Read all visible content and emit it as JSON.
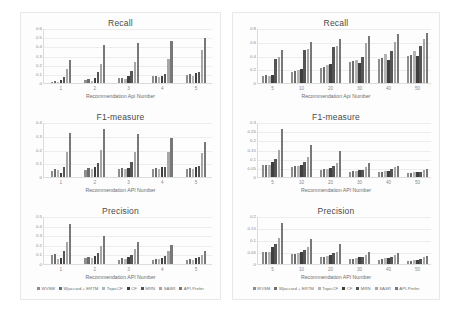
{
  "figure": {
    "background": "#ffffff",
    "panel_background": "#fdfdfd",
    "panel_border": "#e8e8e8"
  },
  "series_names": [
    "WVSM",
    "Wjaccard + ERTM",
    "TopicCF",
    "CF",
    "MRN",
    "SASR",
    "API-Prefer"
  ],
  "series_colors": [
    "#8e8e8e",
    "#6d6d6d",
    "#b4b4b4",
    "#3f3f3f",
    "#555555",
    "#a6a6a6",
    "#787878"
  ],
  "legend": {
    "items": [
      {
        "label": "WVSM",
        "color": "#8e8e8e"
      },
      {
        "label": "Wjaccard + ERTM",
        "color": "#6d6d6d"
      },
      {
        "label": "TopicCF",
        "color": "#b4b4b4"
      },
      {
        "label": "CF",
        "color": "#3f3f3f"
      },
      {
        "label": "MRN",
        "color": "#555555"
      },
      {
        "label": "SASR",
        "color": "#a6a6a6"
      },
      {
        "label": "API-Prefer",
        "color": "#787878"
      }
    ]
  },
  "chart_data": [
    {
      "id": "left-recall",
      "panel": "left",
      "type": "bar",
      "title": "Recall",
      "xlabel": "Recommendation Api Number",
      "ylabel": "",
      "categories": [
        "1",
        "2",
        "3",
        "4",
        "5"
      ],
      "yticks": [
        0,
        0.1,
        0.2,
        0.3,
        0.4,
        0.5,
        0.6
      ],
      "ylim": [
        0,
        0.6
      ],
      "grid": true,
      "legend_position": "bottom",
      "series": [
        {
          "name": "WVSM",
          "values": [
            0.012,
            0.03,
            0.055,
            0.072,
            0.082
          ]
        },
        {
          "name": "Wjaccard + ERTM",
          "values": [
            0.022,
            0.048,
            0.06,
            0.08,
            0.1
          ]
        },
        {
          "name": "TopicCF",
          "values": [
            0.012,
            0.022,
            0.048,
            0.068,
            0.078
          ]
        },
        {
          "name": "CF",
          "values": [
            0.03,
            0.06,
            0.075,
            0.078,
            0.11
          ]
        },
        {
          "name": "MRN",
          "values": [
            0.068,
            0.115,
            0.135,
            0.1,
            0.115
          ]
        },
        {
          "name": "SASR",
          "values": [
            0.15,
            0.21,
            0.23,
            0.265,
            0.365
          ]
        },
        {
          "name": "API-Prefer",
          "values": [
            0.255,
            0.41,
            0.44,
            0.455,
            0.495
          ]
        }
      ]
    },
    {
      "id": "right-recall",
      "panel": "right",
      "type": "bar",
      "title": "Recall",
      "xlabel": "Recommendation Api Number",
      "ylabel": "",
      "categories": [
        "5",
        "10",
        "20",
        "30",
        "40",
        "50"
      ],
      "yticks": [
        0,
        0.2,
        0.4,
        0.6,
        0.8
      ],
      "ylim": [
        0,
        0.8
      ],
      "grid": true,
      "legend_position": "bottom",
      "series": [
        {
          "name": "WVSM",
          "values": [
            0.105,
            0.165,
            0.215,
            0.31,
            0.355,
            0.395
          ]
        },
        {
          "name": "Wjaccard + ERTM",
          "values": [
            0.11,
            0.17,
            0.24,
            0.325,
            0.36,
            0.41
          ]
        },
        {
          "name": "TopicCF",
          "values": [
            0.105,
            0.185,
            0.255,
            0.33,
            0.42,
            0.46
          ]
        },
        {
          "name": "CF",
          "values": [
            0.115,
            0.205,
            0.275,
            0.29,
            0.34,
            0.395
          ]
        },
        {
          "name": "MRN",
          "values": [
            0.35,
            0.48,
            0.52,
            0.375,
            0.465,
            0.54
          ]
        },
        {
          "name": "SASR",
          "values": [
            0.375,
            0.5,
            0.535,
            0.58,
            0.6,
            0.64
          ]
        },
        {
          "name": "API-Prefer",
          "values": [
            0.48,
            0.59,
            0.645,
            0.68,
            0.715,
            0.73
          ]
        }
      ]
    },
    {
      "id": "left-f1",
      "panel": "left",
      "type": "bar",
      "title": "F1-measure",
      "xlabel": "Recommendation API Number",
      "ylabel": "",
      "categories": [
        "1",
        "2",
        "3",
        "4",
        "5"
      ],
      "yticks": [
        0,
        0.1,
        0.2,
        0.3,
        0.4
      ],
      "ylim": [
        0,
        0.4
      ],
      "grid": true,
      "legend_position": "bottom",
      "series": [
        {
          "name": "WVSM",
          "values": [
            0.045,
            0.05,
            0.06,
            0.06,
            0.058
          ]
        },
        {
          "name": "Wjaccard + ERTM",
          "values": [
            0.055,
            0.068,
            0.062,
            0.068,
            0.062
          ]
        },
        {
          "name": "TopicCF",
          "values": [
            0.048,
            0.06,
            0.055,
            0.06,
            0.06
          ]
        },
        {
          "name": "CF",
          "values": [
            0.028,
            0.07,
            0.065,
            0.07,
            0.075
          ]
        },
        {
          "name": "MRN",
          "values": [
            0.07,
            0.105,
            0.11,
            0.07,
            0.08
          ]
        },
        {
          "name": "SASR",
          "values": [
            0.18,
            0.195,
            0.185,
            0.18,
            0.175
          ]
        },
        {
          "name": "API-Prefer",
          "values": [
            0.32,
            0.348,
            0.31,
            0.282,
            0.258
          ]
        }
      ]
    },
    {
      "id": "right-f1",
      "panel": "right",
      "type": "bar",
      "title": "F1-measure",
      "xlabel": "Recommendation API Number",
      "ylabel": "",
      "categories": [
        "5",
        "10",
        "20",
        "30",
        "40",
        "50"
      ],
      "yticks": [
        0,
        0.05,
        0.1,
        0.15,
        0.2,
        0.25,
        0.3
      ],
      "ylim": [
        0,
        0.3
      ],
      "grid": true,
      "legend_position": "bottom",
      "series": [
        {
          "name": "WVSM",
          "values": [
            0.063,
            0.057,
            0.04,
            0.03,
            0.026,
            0.022
          ]
        },
        {
          "name": "Wjaccard + ERTM",
          "values": [
            0.065,
            0.058,
            0.042,
            0.032,
            0.028,
            0.024
          ]
        },
        {
          "name": "TopicCF",
          "values": [
            0.068,
            0.06,
            0.045,
            0.035,
            0.034,
            0.028
          ]
        },
        {
          "name": "CF",
          "values": [
            0.08,
            0.065,
            0.05,
            0.037,
            0.033,
            0.026
          ]
        },
        {
          "name": "MRN",
          "values": [
            0.1,
            0.082,
            0.058,
            0.04,
            0.042,
            0.03
          ]
        },
        {
          "name": "SASR",
          "values": [
            0.15,
            0.108,
            0.075,
            0.052,
            0.055,
            0.04
          ]
        },
        {
          "name": "API-Prefer",
          "values": [
            0.262,
            0.172,
            0.14,
            0.078,
            0.062,
            0.046
          ]
        }
      ]
    },
    {
      "id": "left-precision",
      "panel": "left",
      "type": "bar",
      "title": "Precision",
      "xlabel": "Recommendation API Number",
      "ylabel": "",
      "categories": [
        "1",
        "2",
        "3",
        "4",
        "5"
      ],
      "yticks": [
        0,
        0.1,
        0.2,
        0.3,
        0.4,
        0.5
      ],
      "ylim": [
        0,
        0.5
      ],
      "grid": true,
      "legend_position": "bottom",
      "series": [
        {
          "name": "WVSM",
          "values": [
            0.09,
            0.06,
            0.045,
            0.042,
            0.038
          ]
        },
        {
          "name": "Wjaccard + ERTM",
          "values": [
            0.105,
            0.075,
            0.06,
            0.052,
            0.048
          ]
        },
        {
          "name": "TopicCF",
          "values": [
            0.055,
            0.062,
            0.05,
            0.048,
            0.042
          ]
        },
        {
          "name": "CF",
          "values": [
            0.06,
            0.08,
            0.068,
            0.065,
            0.06
          ]
        },
        {
          "name": "MRN",
          "values": [
            0.14,
            0.115,
            0.098,
            0.088,
            0.072
          ]
        },
        {
          "name": "SASR",
          "values": [
            0.225,
            0.19,
            0.155,
            0.14,
            0.09
          ]
        },
        {
          "name": "API-Prefer",
          "values": [
            0.42,
            0.295,
            0.228,
            0.195,
            0.14
          ]
        }
      ]
    },
    {
      "id": "right-precision",
      "panel": "right",
      "type": "bar",
      "title": "Precision",
      "xlabel": "Recommendation API Number",
      "ylabel": "",
      "categories": [
        "5",
        "10",
        "20",
        "30",
        "40",
        "50"
      ],
      "yticks": [
        0,
        0.05,
        0.1,
        0.15,
        0.2
      ],
      "ylim": [
        0,
        0.2
      ],
      "grid": true,
      "legend_position": "bottom",
      "series": [
        {
          "name": "WVSM",
          "values": [
            0.048,
            0.04,
            0.028,
            0.02,
            0.018,
            0.012
          ]
        },
        {
          "name": "Wjaccard + ERTM",
          "values": [
            0.05,
            0.042,
            0.03,
            0.022,
            0.02,
            0.014
          ]
        },
        {
          "name": "TopicCF",
          "values": [
            0.052,
            0.045,
            0.033,
            0.026,
            0.024,
            0.016
          ]
        },
        {
          "name": "CF",
          "values": [
            0.07,
            0.05,
            0.036,
            0.028,
            0.026,
            0.018
          ]
        },
        {
          "name": "MRN",
          "values": [
            0.082,
            0.06,
            0.044,
            0.03,
            0.03,
            0.022
          ]
        },
        {
          "name": "SASR",
          "values": [
            0.11,
            0.072,
            0.052,
            0.038,
            0.038,
            0.03
          ]
        },
        {
          "name": "API-Prefer",
          "values": [
            0.172,
            0.105,
            0.082,
            0.048,
            0.044,
            0.034
          ]
        }
      ]
    }
  ]
}
